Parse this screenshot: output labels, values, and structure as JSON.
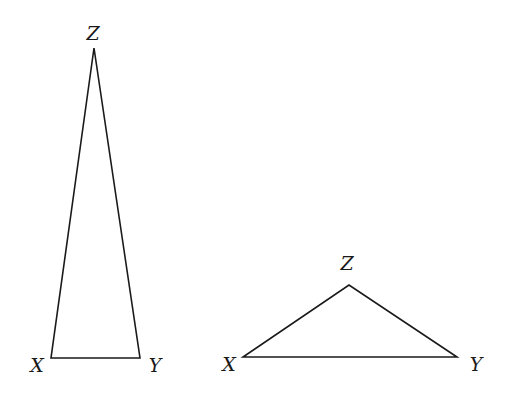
{
  "diagram": {
    "triangles": [
      {
        "id": "tall-triangle",
        "vertices": {
          "X": {
            "label": "X",
            "x": 51,
            "y": 358,
            "lx": 37,
            "ly": 372
          },
          "Y": {
            "label": "Y",
            "x": 140,
            "y": 358,
            "lx": 155,
            "ly": 372
          },
          "Z": {
            "label": "Z",
            "x": 94,
            "y": 48,
            "lx": 93,
            "ly": 40
          }
        }
      },
      {
        "id": "wide-triangle",
        "vertices": {
          "X": {
            "label": "X",
            "x": 243,
            "y": 357,
            "lx": 229,
            "ly": 371
          },
          "Y": {
            "label": "Y",
            "x": 457,
            "y": 357,
            "lx": 476,
            "ly": 371
          },
          "Z": {
            "label": "Z",
            "x": 349,
            "y": 285,
            "lx": 347,
            "ly": 270
          }
        }
      }
    ],
    "colors": {
      "stroke": "#1a1a1a",
      "background": "#ffffff"
    }
  }
}
